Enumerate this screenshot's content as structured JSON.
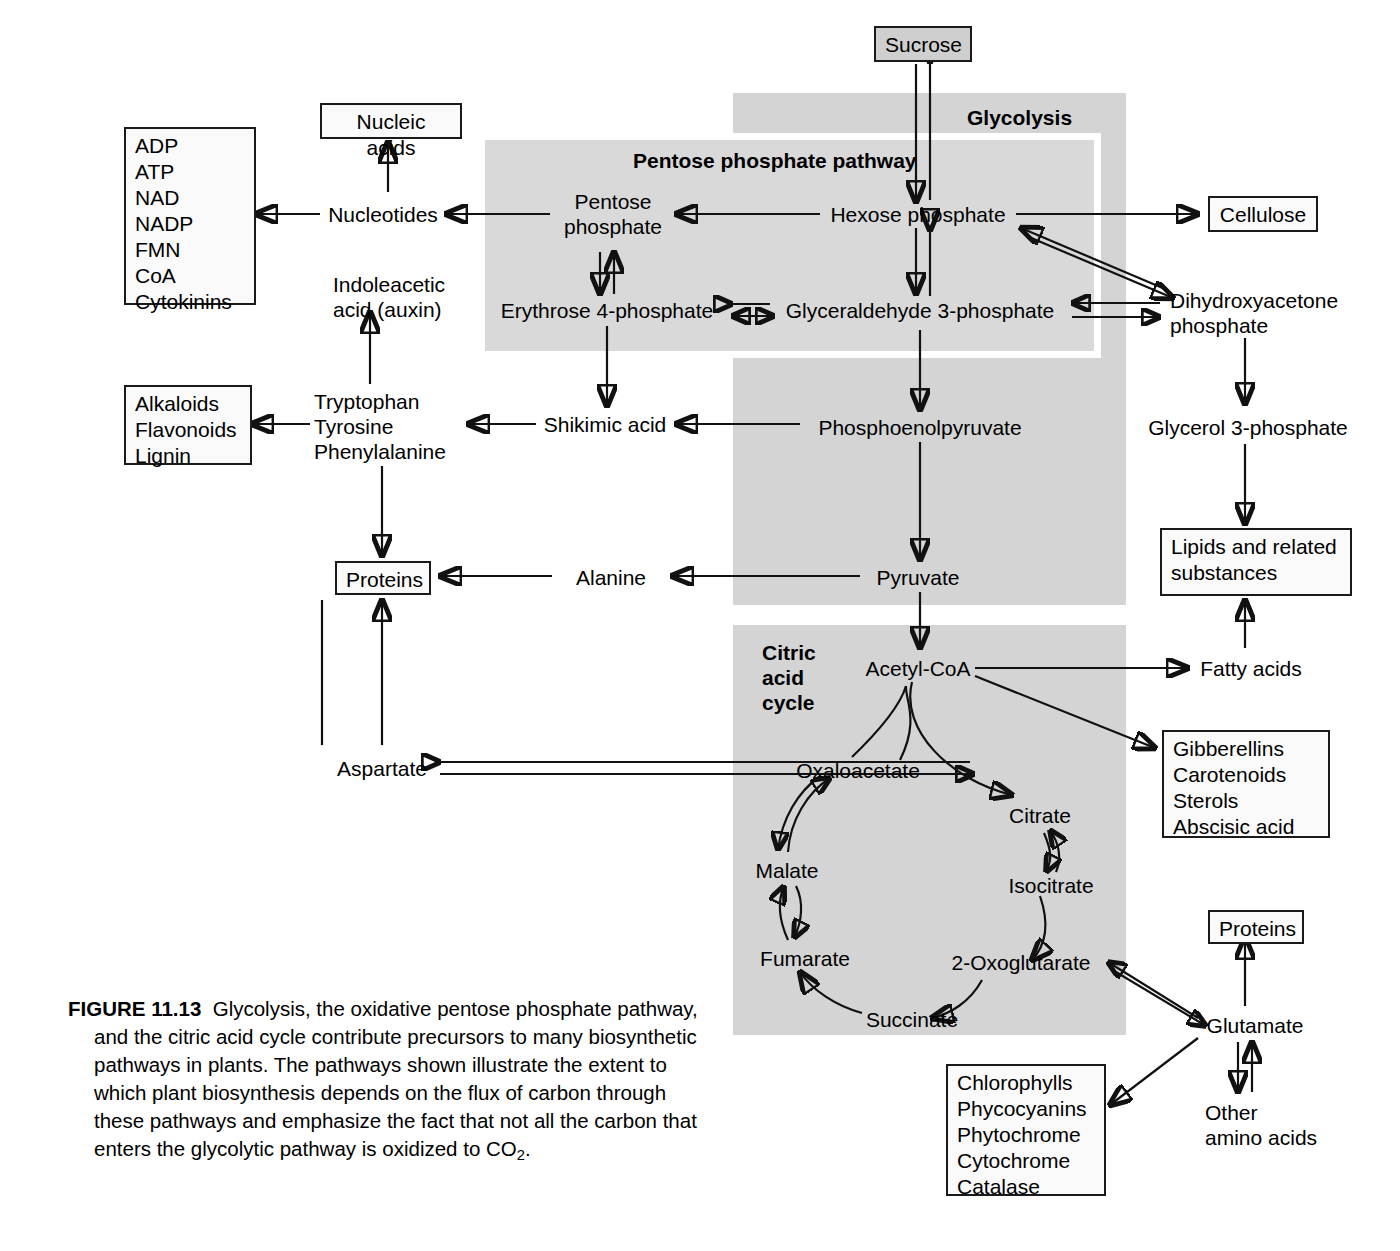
{
  "figure": {
    "number": "FIGURE 11.13",
    "caption": "Glycolysis, the oxidative pentose phosphate pathway, and the citric acid cycle contribute precursors to many biosynthetic pathways in plants. The pathways shown illustrate the extent to which plant biosynthesis depends on the flux of carbon through these pathways and emphasize the fact that not all the carbon that enters the glycolytic pathway is oxidized to CO",
    "caption_sub": "2",
    "caption_end": "."
  },
  "pathway_labels": {
    "glycolysis": "Glycolysis",
    "pentose_phosphate_pathway": "Pentose phosphate pathway",
    "citric_acid_cycle": "Citric\nacid\ncycle",
    "citric_acid_cycle_lines": [
      "Citric",
      "acid",
      "cycle"
    ]
  },
  "boxed_nodes": {
    "sucrose": "Sucrose",
    "nucleic_acids": "Nucleic acids",
    "cellulose": "Cellulose",
    "proteins_left": "Proteins",
    "proteins_right": "Proteins",
    "cofactors": [
      "ADP",
      "ATP",
      "NAD",
      "NADP",
      "FMN",
      "CoA",
      "Cytokinins"
    ],
    "phenolics": [
      "Alkaloids",
      "Flavonoids",
      "Lignin"
    ],
    "lipids": "Lipids and related substances",
    "lipids_lines": [
      "Lipids and related",
      "substances"
    ],
    "terpenoids": [
      "Gibberellins",
      "Carotenoids",
      "Sterols",
      "Abscisic acid"
    ],
    "tetrapyrroles": [
      "Chlorophylls",
      "Phycocyanins",
      "Phytochrome",
      "Cytochrome",
      "Catalase"
    ]
  },
  "metabolites": {
    "hexose_phosphate": "Hexose phosphate",
    "pentose_phosphate_lines": [
      "Pentose",
      "phosphate"
    ],
    "erythrose_4_phosphate": "Erythrose 4-phosphate",
    "glyceraldehyde_3_phosphate": "Glyceraldehyde 3-phosphate",
    "dihydroxyacetone_phosphate_lines": [
      "Dihydroxyacetone",
      "phosphate"
    ],
    "glycerol_3_phosphate": "Glycerol 3-phosphate",
    "phosphoenolpyruvate": "Phosphoenolpyruvate",
    "pyruvate": "Pyruvate",
    "acetyl_coa": "Acetyl-CoA",
    "nucleotides": "Nucleotides",
    "indoleacetic_acid_lines": [
      "Indoleacetic",
      "acid (auxin)"
    ],
    "aromatic_amino_acids": [
      "Tryptophan",
      "Tyrosine",
      "Phenylalanine"
    ],
    "shikimic_acid": "Shikimic acid",
    "alanine": "Alanine",
    "aspartate": "Aspartate",
    "fatty_acids": "Fatty acids",
    "glutamate": "Glutamate",
    "other_amino_acids_lines": [
      "Other",
      "amino acids"
    ]
  },
  "cycle_intermediates": {
    "oxaloacetate": "Oxaloacetate",
    "citrate": "Citrate",
    "isocitrate": "Isocitrate",
    "oxoglutarate": "2-Oxoglutarate",
    "succinate": "Succinate",
    "fumarate": "Fumarate",
    "malate": "Malate"
  },
  "colors": {
    "band_gray": "#d4d4d4",
    "ppp_gray": "#d9d9d9",
    "box_fill": "#f2f2f2",
    "sucrose_fill": "#cfcfcf",
    "stroke": "#111111"
  }
}
